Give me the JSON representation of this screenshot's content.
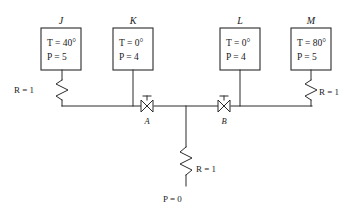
{
  "diagram": {
    "nodes": [
      {
        "id": "J",
        "label": "J",
        "temperature_line": "T = 40°",
        "pressure_line": "P = 5",
        "box": {
          "x": 41,
          "y": 28,
          "w": 40,
          "h": 42
        }
      },
      {
        "id": "K",
        "label": "K",
        "temperature_line": "T = 0°",
        "pressure_line": "P = 4",
        "box": {
          "x": 113,
          "y": 28,
          "w": 40,
          "h": 42
        }
      },
      {
        "id": "L",
        "label": "L",
        "temperature_line": "T = 0°",
        "pressure_line": "P = 4",
        "box": {
          "x": 220,
          "y": 28,
          "w": 40,
          "h": 42
        }
      },
      {
        "id": "M",
        "label": "M",
        "temperature_line": "T = 80°",
        "pressure_line": "P = 5",
        "box": {
          "x": 291,
          "y": 28,
          "w": 40,
          "h": 42
        }
      }
    ],
    "resistors": [
      {
        "id": "R-left",
        "label": "R = 1",
        "label_x": 14,
        "label_y": 93
      },
      {
        "id": "R-right",
        "label": "R = 1",
        "label_x": 313,
        "label_y": 95
      },
      {
        "id": "R-bottom",
        "label": "R = 1",
        "label_x": 192,
        "label_y": 174
      }
    ],
    "valves": [
      {
        "id": "A",
        "label": "A",
        "x": 147,
        "y": 106
      },
      {
        "id": "B",
        "label": "B",
        "x": 224,
        "y": 106
      }
    ],
    "terminal": {
      "id": "ground",
      "label": "P = 0",
      "label_x": 163,
      "label_y": 202
    },
    "colors": {
      "line": "#2b2b2b",
      "text": "#1a1a1a",
      "background": "#ffffff"
    }
  }
}
